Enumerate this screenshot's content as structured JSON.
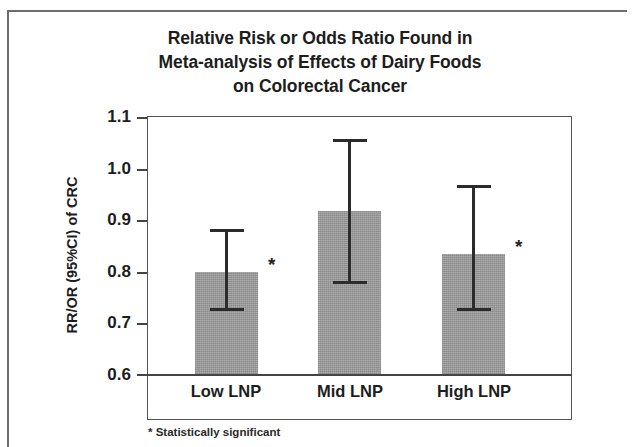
{
  "chart_data": {
    "type": "bar",
    "title": "Relative Risk or Odds Ratio Found in Meta-analysis of Effects of Dairy Foods on Colorectal Cancer",
    "title_lines": [
      "Relative Risk or Odds Ratio Found in",
      "Meta-analysis of Effects of Dairy Foods",
      "on Colorectal Cancer"
    ],
    "xlabel": "",
    "ylabel": "RR/OR (95%CI) of CRC",
    "ylim": [
      0.6,
      1.1
    ],
    "ytick_labels": [
      "1.1",
      "1.0",
      "0.9",
      "0.8",
      "0.7",
      "0.6"
    ],
    "ytick_values": [
      1.1,
      1.0,
      0.9,
      0.8,
      0.7,
      0.6
    ],
    "grid": false,
    "legend": false,
    "categories": [
      "Low LNP",
      "Mid LNP",
      "High LNP"
    ],
    "values": [
      0.8,
      0.917,
      0.835
    ],
    "error_low": [
      0.727,
      0.78,
      0.726
    ],
    "error_high": [
      0.88,
      1.055,
      0.965
    ],
    "significance_markers": [
      "*",
      "",
      "*"
    ],
    "bars": [
      {
        "category": "Low LNP",
        "value": 0.8,
        "ci_low": 0.727,
        "ci_high": 0.88,
        "significant": true,
        "marker": "*"
      },
      {
        "category": "Mid LNP",
        "value": 0.917,
        "ci_low": 0.78,
        "ci_high": 1.055,
        "significant": false,
        "marker": ""
      },
      {
        "category": "High LNP",
        "value": 0.835,
        "ci_low": 0.726,
        "ci_high": 0.965,
        "significant": true,
        "marker": "*"
      }
    ],
    "annotations": [
      "* Statistically significant"
    ],
    "bar_color": "#9b9b9b",
    "errorbar_color": "#2b2b2b",
    "axis_color": "#555555"
  },
  "footnote": "* Statistically significant"
}
